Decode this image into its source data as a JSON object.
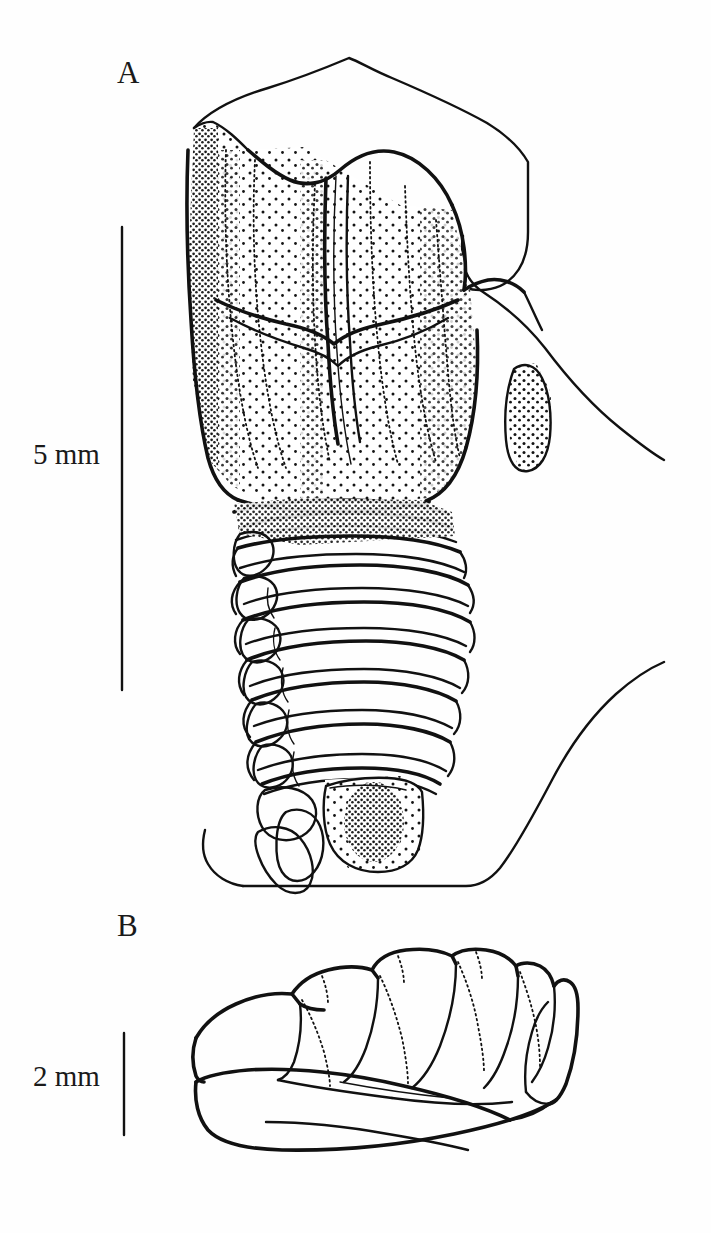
{
  "figure": {
    "kind": "scientific-line-drawing",
    "background_color": "#fefefe",
    "ink_color": "#111111",
    "panels": [
      {
        "label": "A",
        "description": "Dorsal view of beetle abdomen with pronotum, elytra and segmented abdominal tergites, stippled shading",
        "scale_bar": {
          "label": "5 mm",
          "length_px": 463,
          "orientation": "vertical"
        }
      },
      {
        "label": "B",
        "description": "Lateral view of segmented abdomen showing six lobed segments",
        "scale_bar": {
          "label": "2 mm",
          "length_px": 102,
          "orientation": "vertical"
        }
      }
    ]
  },
  "labels": {
    "panel_a": "A",
    "panel_b": "B"
  },
  "scales": {
    "panel_a_scale": "5 mm",
    "panel_b_scale": "2 mm"
  },
  "icons": {
    "scale_bar_a": "vertical-scale-bar-icon",
    "scale_bar_b": "vertical-scale-bar-icon"
  }
}
